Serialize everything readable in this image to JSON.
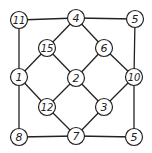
{
  "diagram": {
    "type": "graph",
    "stroke_color": "#222222",
    "node_fill": "#ffffff",
    "nodes": [
      {
        "id": "n11",
        "label": "11",
        "x": 19,
        "y": 20
      },
      {
        "id": "n4",
        "label": "4",
        "x": 76,
        "y": 18
      },
      {
        "id": "n5a",
        "label": "5",
        "x": 135,
        "y": 19
      },
      {
        "id": "n15",
        "label": "15",
        "x": 47,
        "y": 48
      },
      {
        "id": "n6",
        "label": "6",
        "x": 104,
        "y": 48
      },
      {
        "id": "n1",
        "label": "1",
        "x": 19,
        "y": 77
      },
      {
        "id": "n2",
        "label": "2",
        "x": 76,
        "y": 78
      },
      {
        "id": "n10",
        "label": "10",
        "x": 134,
        "y": 77
      },
      {
        "id": "n12",
        "label": "12",
        "x": 47,
        "y": 107
      },
      {
        "id": "n3",
        "label": "3",
        "x": 104,
        "y": 107
      },
      {
        "id": "n8",
        "label": "8",
        "x": 19,
        "y": 137
      },
      {
        "id": "n7",
        "label": "7",
        "x": 76,
        "y": 136
      },
      {
        "id": "n5b",
        "label": "5",
        "x": 134,
        "y": 137
      }
    ],
    "edges": [
      [
        "n11",
        "n4"
      ],
      [
        "n4",
        "n5a"
      ],
      [
        "n11",
        "n1"
      ],
      [
        "n5a",
        "n10"
      ],
      [
        "n4",
        "n15"
      ],
      [
        "n4",
        "n6"
      ],
      [
        "n15",
        "n1"
      ],
      [
        "n15",
        "n2"
      ],
      [
        "n6",
        "n2"
      ],
      [
        "n6",
        "n10"
      ],
      [
        "n1",
        "n12"
      ],
      [
        "n1",
        "n8"
      ],
      [
        "n2",
        "n12"
      ],
      [
        "n2",
        "n3"
      ],
      [
        "n10",
        "n3"
      ],
      [
        "n10",
        "n5b"
      ],
      [
        "n12",
        "n7"
      ],
      [
        "n3",
        "n7"
      ],
      [
        "n8",
        "n7"
      ],
      [
        "n7",
        "n5b"
      ]
    ]
  }
}
